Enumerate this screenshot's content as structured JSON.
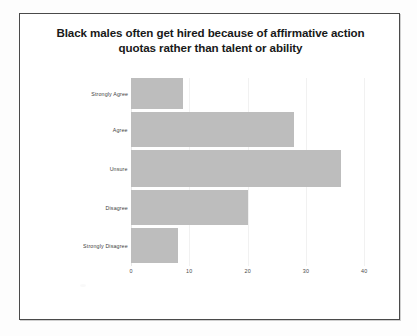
{
  "chart_data": {
    "type": "bar",
    "orientation": "horizontal",
    "title": "Black males often get hired because of affirmative action quotas rather than talent or ability",
    "title_line1": "Black males often get hired because of affirmative action",
    "title_line2": "quotas rather than talent or ability",
    "categories": [
      "Strongly Agree",
      "Agree",
      "Unsure",
      "Disagree",
      "Strongly Disagree"
    ],
    "values": [
      9,
      28,
      36,
      20,
      8
    ],
    "xlabel": "",
    "ylabel": "",
    "xlim": [
      0,
      42
    ],
    "xticks": [
      0,
      10,
      20,
      30,
      40
    ],
    "xtick_labels": [
      "0",
      "10",
      "20",
      "30",
      "40"
    ],
    "grid": true,
    "legend": false,
    "bar_color": "#bdbdbd",
    "title_color": "#191919",
    "frame_color": "#4a4a4a",
    "background": "#ffffff"
  }
}
